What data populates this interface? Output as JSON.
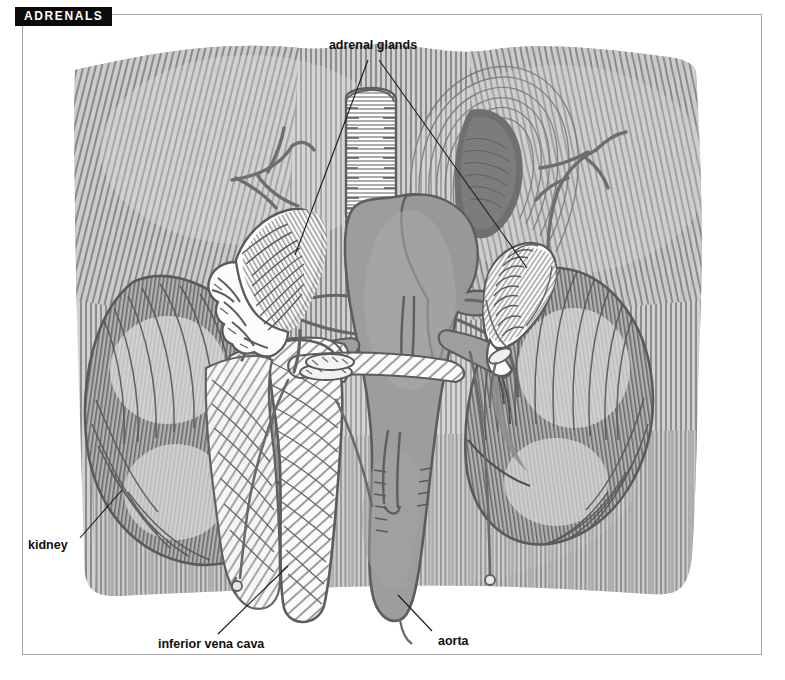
{
  "page": {
    "section_tab_label": "ADRENALS",
    "background_color": "#ffffff",
    "frame_color": "#a6a6a6",
    "tab_bg_color": "#0b0b0b",
    "tab_text_color": "#ffffff"
  },
  "figure": {
    "kind": "anatomical-line-illustration",
    "style": "pen-and-ink hatched engraving, grayscale",
    "ink_color": "#5b5b5b",
    "tissue_fill": "#b9b9b9",
    "vessel_dark_fill": "#9b9b9b",
    "gland_fill": "#fdfdfd",
    "labels": [
      {
        "id": "adrenal-glands",
        "text": "adrenal glands",
        "text_x": 373,
        "text_y": 49,
        "anchor": "middle",
        "leaders": [
          {
            "x1": 368,
            "y1": 60,
            "x2": 295,
            "y2": 255
          },
          {
            "x1": 379,
            "y1": 60,
            "x2": 527,
            "y2": 268
          }
        ]
      },
      {
        "id": "kidney",
        "text": "kidney",
        "text_x": 28,
        "text_y": 549,
        "anchor": "start",
        "leaders": [
          {
            "x1": 80,
            "y1": 538,
            "x2": 122,
            "y2": 490
          }
        ]
      },
      {
        "id": "inferior-vena-cava",
        "text": "inferior vena cava",
        "text_x": 158,
        "text_y": 648,
        "anchor": "start",
        "leaders": [
          {
            "x1": 218,
            "y1": 634,
            "x2": 288,
            "y2": 566
          }
        ]
      },
      {
        "id": "aorta",
        "text": "aorta",
        "text_x": 438,
        "text_y": 645,
        "anchor": "start",
        "leaders": [
          {
            "x1": 432,
            "y1": 631,
            "x2": 398,
            "y2": 595
          }
        ]
      }
    ],
    "structures": [
      {
        "id": "background-muscle",
        "name": "posterior abdominal wall muscle",
        "tone": "hatched light gray"
      },
      {
        "id": "diaphragm-opening",
        "name": "dark oval opening in diaphragm",
        "tone": "dark gray"
      },
      {
        "id": "left-adrenal-gland",
        "name": "adrenal gland (viewer left)",
        "tone": "white with hatching"
      },
      {
        "id": "right-adrenal-gland",
        "name": "adrenal gland (viewer right)",
        "tone": "white with chevron hatching"
      },
      {
        "id": "left-kidney",
        "name": "kidney (viewer left)",
        "tone": "mid gray, hatched"
      },
      {
        "id": "right-kidney",
        "name": "kidney (viewer right)",
        "tone": "mid gray, hatched"
      },
      {
        "id": "aorta",
        "name": "aorta",
        "tone": "dark gray tube"
      },
      {
        "id": "inferior-vena-cava",
        "name": "inferior vena cava",
        "tone": "light diagonally hatched tube"
      },
      {
        "id": "esophagus-stump",
        "name": "esophagus cut end",
        "tone": "white rounded tube"
      },
      {
        "id": "renal-vessels",
        "name": "renal arteries and veins",
        "tone": "gray branching tubes"
      },
      {
        "id": "suprarenal-branches",
        "name": "branching suprarenal vessels",
        "tone": "gray thin branches"
      }
    ]
  }
}
